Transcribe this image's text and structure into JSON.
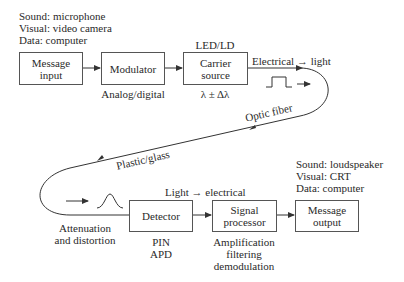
{
  "input_sources": {
    "line1": "Sound: microphone",
    "line2": "Visual: video camera",
    "line3": "Data: computer"
  },
  "blocks": {
    "message_input": {
      "line1": "Message",
      "line2": "input"
    },
    "modulator": {
      "line1": "Modulator",
      "caption": "Analog/digital"
    },
    "carrier_source": {
      "line1": "Carrier",
      "line2": "source",
      "top_label": "LED/LD",
      "caption": "λ ± Δλ"
    },
    "detector": {
      "line1": "Detector",
      "caption1": "PIN",
      "caption2": "APD"
    },
    "signal_processor": {
      "line1": "Signal",
      "line2": "processor",
      "caption1": "Amplification",
      "caption2": "filtering",
      "caption3": "demodulation"
    },
    "message_output": {
      "line1": "Message",
      "line2": "output"
    }
  },
  "output_sinks": {
    "line1": "Sound: loudspeaker",
    "line2": "Visual: CRT",
    "line3": "Data: computer"
  },
  "labels": {
    "electrical_to_light": "Electrical → light",
    "optic_fiber": "Optic fiber",
    "plastic_glass": "Plastic/glass",
    "light_to_electrical": "Light → electrical",
    "attenuation1": "Attenuation",
    "attenuation2": "and distortion"
  }
}
